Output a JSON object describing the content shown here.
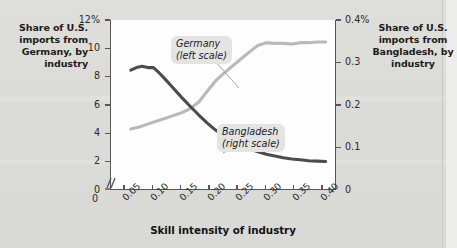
{
  "chart_data": {
    "type": "line",
    "title": "",
    "xlabel": "Skill intensity of industry",
    "xticks": [
      "0.05",
      "0.10",
      "0.15",
      "0.20",
      "0.25",
      "0.30",
      "0.35",
      "0.40"
    ],
    "x_origin_label": "0",
    "xlim": [
      0.025,
      0.425
    ],
    "grid": false,
    "legend_position": "in-plot annotations",
    "axes": [
      {
        "id": "left",
        "caption": "Share of U.S. imports from Germany, by industry",
        "ticks": [
          "12%",
          "10",
          "8",
          "6",
          "4",
          "2",
          "0"
        ],
        "tick_values": [
          12,
          10,
          8,
          6,
          4,
          2,
          0
        ],
        "ylim": [
          0,
          12
        ],
        "broken_axis": true
      },
      {
        "id": "right",
        "caption": "Share of U.S. imports from Bangladesh, by industry",
        "ticks": [
          "0.4%",
          "0.3",
          "0.2",
          "0.1",
          "0"
        ],
        "tick_values": [
          0.4,
          0.3,
          0.2,
          0.1,
          0
        ],
        "ylim": [
          0,
          0.4
        ]
      }
    ],
    "series": [
      {
        "name": "Germany",
        "annotation": "Germany\n(left scale)",
        "annotation_line1": "Germany",
        "annotation_line2": "(left scale)",
        "scale": "left",
        "color": "#b9b9b9",
        "x": [
          0.06,
          0.075,
          0.09,
          0.105,
          0.12,
          0.135,
          0.15,
          0.165,
          0.18,
          0.195,
          0.21,
          0.225,
          0.24,
          0.255,
          0.27,
          0.285,
          0.3,
          0.315,
          0.33,
          0.345,
          0.36,
          0.375,
          0.39,
          0.405
        ],
        "values": [
          4.3,
          4.45,
          4.65,
          4.85,
          5.05,
          5.25,
          5.45,
          5.75,
          6.2,
          6.95,
          7.7,
          8.25,
          8.75,
          9.25,
          9.75,
          10.2,
          10.4,
          10.35,
          10.35,
          10.3,
          10.4,
          10.4,
          10.45,
          10.45
        ]
      },
      {
        "name": "Bangladesh",
        "annotation": "Bangladesh\n(right scale)",
        "annotation_line1": "Bangladesh",
        "annotation_line2": "(right scale)",
        "scale": "right",
        "color": "#4c4c4c",
        "x": [
          0.06,
          0.07,
          0.08,
          0.09,
          0.1,
          0.11,
          0.12,
          0.135,
          0.15,
          0.165,
          0.18,
          0.195,
          0.21,
          0.225,
          0.24,
          0.255,
          0.27,
          0.285,
          0.3,
          0.315,
          0.33,
          0.345,
          0.36,
          0.375,
          0.39,
          0.405
        ],
        "values": [
          0.282,
          0.288,
          0.291,
          0.288,
          0.288,
          0.276,
          0.262,
          0.24,
          0.218,
          0.197,
          0.177,
          0.158,
          0.141,
          0.127,
          0.115,
          0.105,
          0.097,
          0.09,
          0.084,
          0.08,
          0.076,
          0.073,
          0.071,
          0.069,
          0.068,
          0.067
        ]
      }
    ]
  }
}
